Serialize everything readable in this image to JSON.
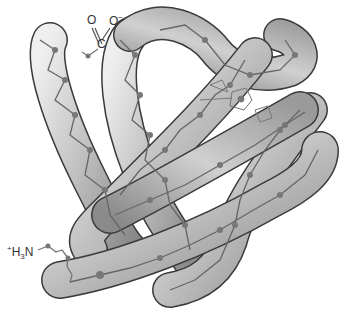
{
  "diagram": {
    "labels": {
      "c_terminus": {
        "o1": "O",
        "o2": "O",
        "charge": "−",
        "carbon": "C"
      },
      "n_terminus": {
        "charge": "+",
        "h": "H",
        "subscript": "3",
        "n": "N"
      }
    },
    "colors": {
      "tube_light": "#e6e6e6",
      "tube_mid": "#b4b4b4",
      "tube_dark": "#7a7a7a",
      "outline": "#3a3a3a",
      "backbone": "#666666",
      "atom": "#777777",
      "text": "#333333"
    }
  }
}
